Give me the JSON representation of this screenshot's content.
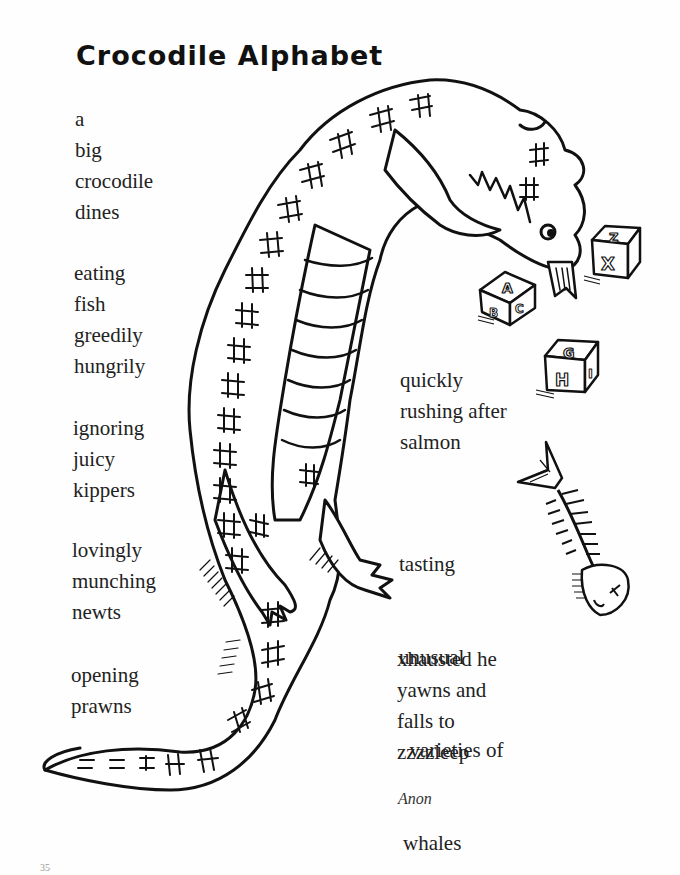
{
  "page": {
    "title": "Crocodile Alphabet",
    "author": "Anon",
    "page_number": "35"
  },
  "poem": {
    "stanzas": [
      {
        "lines": [
          "a",
          "big",
          "crocodile",
          "dines"
        ]
      },
      {
        "lines": [
          "eating",
          "fish",
          "greedily",
          "hungrily"
        ]
      },
      {
        "lines": [
          "ignoring",
          "juicy",
          "kippers"
        ]
      },
      {
        "lines": [
          "lovingly",
          "munching",
          "newts"
        ]
      },
      {
        "lines": [
          "opening",
          "prawns"
        ]
      },
      {
        "lines": [
          "quickly",
          "rushing after",
          "salmon"
        ]
      },
      {
        "lines": [
          "tasting",
          "unusual",
          "  varieties of",
          "whales"
        ]
      },
      {
        "lines": [
          "xhausted he",
          "yawns and",
          "falls to",
          "zzzzleep"
        ]
      }
    ]
  },
  "illustration": {
    "subject": "crocodile-icon",
    "blocks": [
      {
        "faces": [
          "A",
          "B",
          "C"
        ]
      },
      {
        "faces": [
          "Z",
          "X"
        ]
      },
      {
        "faces": [
          "G",
          "H",
          "I"
        ]
      }
    ],
    "fish_skeleton": "fish-skeleton-icon",
    "line_color": "#111111",
    "paper_color": "#fefefe"
  }
}
